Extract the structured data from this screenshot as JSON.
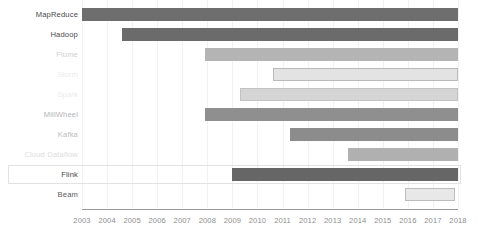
{
  "chart_data": {
    "type": "bar",
    "orientation": "horizontal",
    "subtype": "gantt-timeline",
    "title": "",
    "subtitle": "",
    "xlabel": "",
    "ylabel": "",
    "xlim": [
      2003,
      2018
    ],
    "grid": true,
    "legend": "none",
    "xticks": [
      "2003",
      "2004",
      "2005",
      "2006",
      "2007",
      "2008",
      "2009",
      "2010",
      "2011",
      "2012",
      "2013",
      "2014",
      "2015",
      "2016",
      "2017",
      "2018"
    ],
    "categories": [
      "MapReduce",
      "Hadoop",
      "Flume",
      "Storm",
      "Spark",
      "MillWheel",
      "Kafka",
      "Cloud Dataflow",
      "Flink",
      "Beam"
    ],
    "bars": [
      {
        "label": "MapReduce",
        "start": 2003.0,
        "end": 2018.0,
        "fill": "#6e6e6e",
        "stroke": "#6e6e6e",
        "label_color": "#4a4a4a",
        "highlighted": false
      },
      {
        "label": "Hadoop",
        "start": 2004.6,
        "end": 2018.0,
        "fill": "#6b6b6b",
        "stroke": "#6b6b6b",
        "label_color": "#4a4a4a",
        "highlighted": false
      },
      {
        "label": "Flume",
        "start": 2007.9,
        "end": 2018.0,
        "fill": "#b4b4b4",
        "stroke": "#b4b4b4",
        "label_color": "#cfcfcf",
        "highlighted": false
      },
      {
        "label": "Storm",
        "start": 2010.6,
        "end": 2018.0,
        "fill": "#e3e3e3",
        "stroke": "#b9b9b9",
        "label_color": "#ececec",
        "highlighted": false
      },
      {
        "label": "Spark",
        "start": 2009.3,
        "end": 2018.0,
        "fill": "#d5d5d5",
        "stroke": "#c2c2c2",
        "label_color": "#ebebeb",
        "highlighted": false
      },
      {
        "label": "MillWheel",
        "start": 2007.9,
        "end": 2018.0,
        "fill": "#8f8f8f",
        "stroke": "#8f8f8f",
        "label_color": "#b4b4b4",
        "highlighted": false
      },
      {
        "label": "Kafka",
        "start": 2011.3,
        "end": 2018.0,
        "fill": "#8c8c8c",
        "stroke": "#8c8c8c",
        "label_color": "#bdbdbd",
        "highlighted": false
      },
      {
        "label": "Cloud Dataflow",
        "start": 2013.6,
        "end": 2018.0,
        "fill": "#b0b0b0",
        "stroke": "#b0b0b0",
        "label_color": "#dcdcdc",
        "highlighted": false
      },
      {
        "label": "Flink",
        "start": 2009.0,
        "end": 2018.0,
        "fill": "#666666",
        "stroke": "#666666",
        "label_color": "#3f3f3f",
        "highlighted": true
      },
      {
        "label": "Beam",
        "start": 2015.9,
        "end": 2017.9,
        "fill": "#e8e8e8",
        "stroke": "#bcbcbc",
        "label_color": "#5a5a5a",
        "highlighted": false
      }
    ]
  },
  "axis": {
    "line_color": "#9a9a9a",
    "tick_color": "#8e8e8e"
  },
  "highlight": {
    "border_color": "#e2e2e2"
  }
}
